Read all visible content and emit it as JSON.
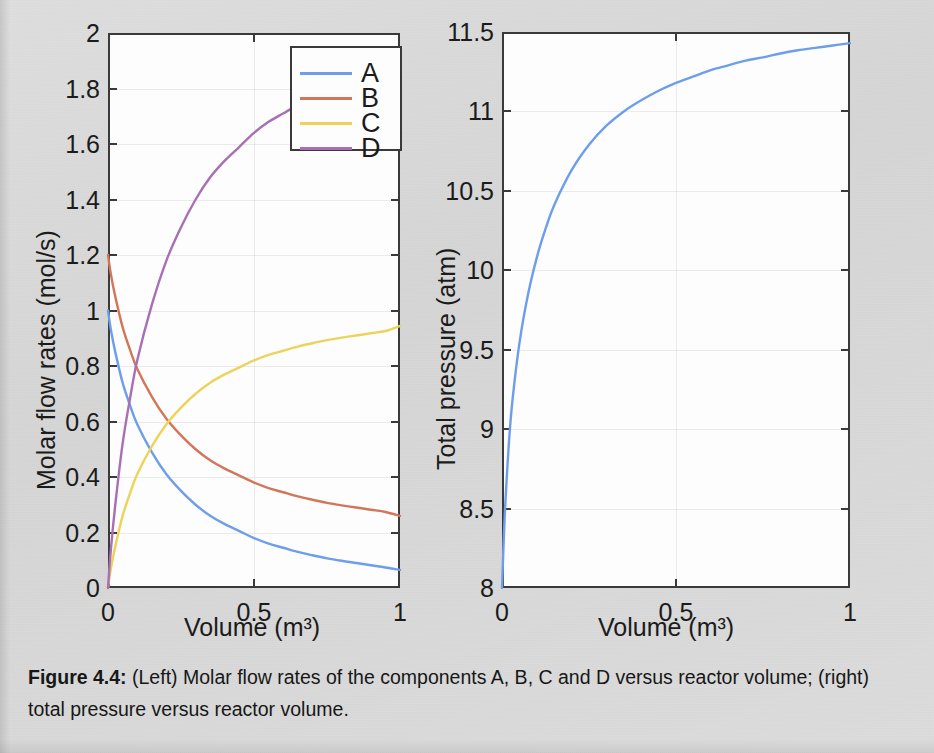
{
  "caption": {
    "label": "Figure 4.4:",
    "text": " (Left) Molar flow rates of the components A, B, C and D versus reactor volume; (right) total pressure versus reactor volume."
  },
  "colors": {
    "series_a": "#6d9eeb",
    "series_b": "#d2765a",
    "series_c": "#edd35c",
    "series_d": "#a86fb5",
    "axis": "#3a3a3a",
    "plot_background": "#fdfdfd",
    "page_background": "#d9d9d9"
  },
  "left_plot": {
    "xlabel": "Volume (m³)",
    "ylabel": "Molar flow rates (mol/s)",
    "xticks": [
      "0",
      "0.5",
      "1"
    ],
    "yticks": [
      "0",
      "0.2",
      "0.4",
      "0.6",
      "0.8",
      "1",
      "1.2",
      "1.4",
      "1.6",
      "1.8",
      "2"
    ],
    "legend": {
      "items": [
        {
          "label": "A",
          "color": "#6d9eeb"
        },
        {
          "label": "B",
          "color": "#d2765a"
        },
        {
          "label": "C",
          "color": "#edd35c"
        },
        {
          "label": "D",
          "color": "#a86fb5"
        }
      ]
    }
  },
  "right_plot": {
    "xlabel": "Volume (m³)",
    "ylabel": "Total pressure (atm)",
    "xticks": [
      "0",
      "0.5",
      "1"
    ],
    "yticks": [
      "8",
      "8.5",
      "9",
      "9.5",
      "10",
      "10.5",
      "11",
      "11.5"
    ]
  },
  "chart_data": [
    {
      "type": "line",
      "title": "Molar flow rates of components A, B, C and D versus reactor volume",
      "xlabel": "Volume (m³)",
      "ylabel": "Molar flow rates (mol/s)",
      "xlim": [
        0,
        1
      ],
      "ylim": [
        0,
        2
      ],
      "xticks": [
        0,
        0.5,
        1
      ],
      "yticks": [
        0,
        0.2,
        0.4,
        0.6,
        0.8,
        1,
        1.2,
        1.4,
        1.6,
        1.8,
        2
      ],
      "grid": true,
      "legend_position": "top-right",
      "x": [
        0,
        0.01,
        0.025,
        0.05,
        0.075,
        0.1,
        0.15,
        0.2,
        0.25,
        0.3,
        0.35,
        0.4,
        0.45,
        0.5,
        0.55,
        0.6,
        0.65,
        0.7,
        0.75,
        0.8,
        0.85,
        0.9,
        0.95,
        1
      ],
      "series": [
        {
          "name": "A",
          "color": "#6d9eeb",
          "values": [
            1.0,
            0.93,
            0.85,
            0.74,
            0.66,
            0.59,
            0.49,
            0.41,
            0.35,
            0.3,
            0.26,
            0.23,
            0.205,
            0.18,
            0.16,
            0.145,
            0.13,
            0.118,
            0.107,
            0.098,
            0.09,
            0.082,
            0.074,
            0.065
          ]
        },
        {
          "name": "B",
          "color": "#d2765a",
          "values": [
            1.2,
            1.13,
            1.05,
            0.94,
            0.86,
            0.79,
            0.69,
            0.61,
            0.55,
            0.5,
            0.46,
            0.43,
            0.405,
            0.38,
            0.36,
            0.345,
            0.33,
            0.318,
            0.307,
            0.298,
            0.29,
            0.282,
            0.274,
            0.26
          ]
        },
        {
          "name": "C",
          "color": "#edd35c",
          "values": [
            0.0,
            0.07,
            0.15,
            0.26,
            0.34,
            0.41,
            0.51,
            0.59,
            0.65,
            0.7,
            0.74,
            0.77,
            0.795,
            0.82,
            0.84,
            0.855,
            0.87,
            0.882,
            0.893,
            0.902,
            0.91,
            0.918,
            0.926,
            0.945
          ]
        },
        {
          "name": "D",
          "color": "#a86fb5",
          "values": [
            0.0,
            0.14,
            0.3,
            0.52,
            0.68,
            0.82,
            1.02,
            1.18,
            1.3,
            1.4,
            1.48,
            1.54,
            1.59,
            1.64,
            1.68,
            1.71,
            1.74,
            1.764,
            1.786,
            1.804,
            1.82,
            1.836,
            1.852,
            1.89
          ]
        }
      ]
    },
    {
      "type": "line",
      "title": "Total pressure versus reactor volume",
      "xlabel": "Volume (m³)",
      "ylabel": "Total pressure (atm)",
      "xlim": [
        0,
        1
      ],
      "ylim": [
        8,
        11.5
      ],
      "xticks": [
        0,
        0.5,
        1
      ],
      "yticks": [
        8,
        8.5,
        9,
        9.5,
        10,
        10.5,
        11,
        11.5
      ],
      "grid": true,
      "legend_position": "none",
      "x": [
        0,
        0.005,
        0.01,
        0.02,
        0.03,
        0.05,
        0.075,
        0.1,
        0.125,
        0.15,
        0.2,
        0.25,
        0.3,
        0.35,
        0.4,
        0.45,
        0.5,
        0.55,
        0.6,
        0.65,
        0.7,
        0.75,
        0.8,
        0.85,
        0.9,
        0.95,
        1
      ],
      "series": [
        {
          "name": "Total pressure",
          "color": "#6d9eeb",
          "values": [
            8.0,
            8.3,
            8.55,
            8.92,
            9.18,
            9.54,
            9.85,
            10.08,
            10.26,
            10.41,
            10.63,
            10.79,
            10.91,
            11.0,
            11.07,
            11.13,
            11.18,
            11.22,
            11.26,
            11.29,
            11.32,
            11.34,
            11.365,
            11.385,
            11.4,
            11.415,
            11.43
          ]
        }
      ]
    }
  ]
}
